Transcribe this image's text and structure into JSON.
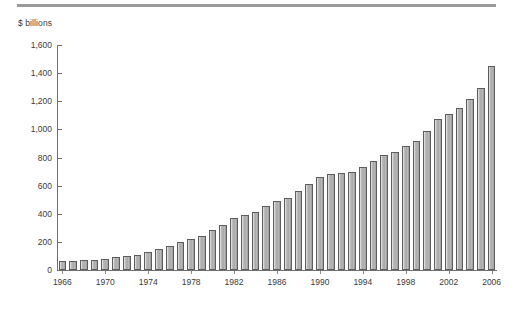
{
  "figure": {
    "top_rule": "horizontal-rule",
    "background_color": "#ffffff"
  },
  "chart_data": {
    "type": "bar",
    "title": "",
    "subtitle": "",
    "xlabel": "",
    "ylabel": "$ billions",
    "ylim": [
      0,
      1600
    ],
    "ytick_labels": [
      "0",
      "200",
      "400",
      "600",
      "800",
      "1,000",
      "1,200",
      "1,400",
      "1,600"
    ],
    "ytick_values": [
      0,
      200,
      400,
      600,
      800,
      1000,
      1200,
      1400,
      1600
    ],
    "xtick_labels": [
      "1966",
      "1970",
      "1974",
      "1978",
      "1982",
      "1986",
      "1990",
      "1994",
      "1998",
      "2002",
      "2006"
    ],
    "xtick_values": [
      1966,
      1970,
      1974,
      1978,
      1982,
      1986,
      1990,
      1994,
      1998,
      2002,
      2006
    ],
    "grid": false,
    "legend": null,
    "bar_color": "#b0b0b0",
    "bar_edge_color": "#5d5d5d",
    "categories": [
      "1966",
      "1967",
      "1968",
      "1969",
      "1970",
      "1971",
      "1972",
      "1973",
      "1974",
      "1975",
      "1976",
      "1977",
      "1978",
      "1979",
      "1980",
      "1981",
      "1982",
      "1983",
      "1984",
      "1985",
      "1986",
      "1987",
      "1988",
      "1989",
      "1990",
      "1991",
      "1992",
      "1993",
      "1994",
      "1995",
      "1996",
      "1997",
      "1998",
      "1999",
      "2000",
      "2001",
      "2002",
      "2003",
      "2004",
      "2005",
      "2006"
    ],
    "values": [
      62,
      65,
      70,
      72,
      80,
      95,
      100,
      105,
      125,
      150,
      170,
      200,
      220,
      245,
      285,
      320,
      370,
      390,
      415,
      455,
      490,
      515,
      565,
      615,
      660,
      685,
      690,
      700,
      730,
      775,
      820,
      840,
      885,
      915,
      985,
      1075,
      1110,
      1155,
      1215,
      1295,
      1450
    ]
  }
}
